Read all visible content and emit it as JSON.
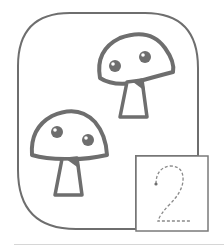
{
  "illustration": {
    "subject": "mushrooms counting card",
    "mushroom_count": 2,
    "stroke_color": "#6e6e6e",
    "fill_color": "#ffffff",
    "shade_color": "#6e6e6e"
  },
  "number_card": {
    "digit": "2",
    "style": "dashed tracing",
    "stroke_color": "#8a8a8a",
    "border_color": "#7a7a7a"
  },
  "colors": {
    "frame": "#6e6e6e",
    "rule": "#d6d6d6",
    "background": "#ffffff"
  }
}
